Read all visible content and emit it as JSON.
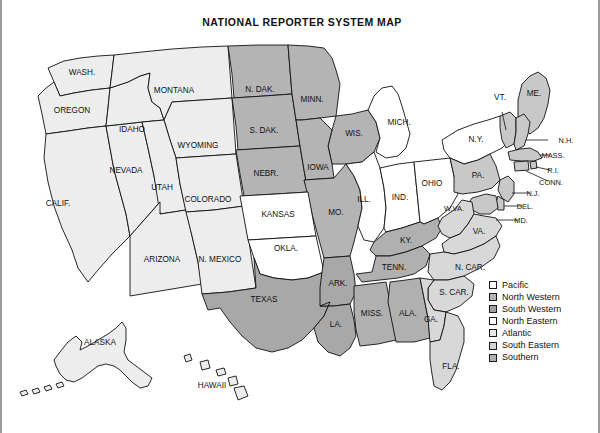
{
  "title": "NATIONAL REPORTER SYSTEM MAP",
  "colors": {
    "pacific": "#ededed",
    "north_western": "#b4b4b4",
    "south_western": "#a8a8a8",
    "north_eastern": "#ffffff",
    "atlantic": "#c8c8c8",
    "south_eastern": "#d8d8d8",
    "southern": "#b0b0b0",
    "outline": "#111111",
    "background": "#ffffff",
    "border": "#9b9b9b"
  },
  "legend": {
    "items": [
      {
        "label": "Pacific",
        "swatch": "#ededed"
      },
      {
        "label": "North Western",
        "swatch": "#b4b4b4"
      },
      {
        "label": "South Western",
        "swatch": "#a8a8a8"
      },
      {
        "label": "North Eastern",
        "swatch": "#ffffff"
      },
      {
        "label": "Atlantic",
        "swatch": "#e2e2e2"
      },
      {
        "label": "South Eastern",
        "swatch": "#d8d8d8"
      },
      {
        "label": "Southern",
        "swatch": "#b0b0b0"
      }
    ]
  },
  "map": {
    "states": [
      {
        "code": "WA",
        "label": "WASH.",
        "region": "Pacific"
      },
      {
        "code": "OR",
        "label": "OREGON",
        "region": "Pacific"
      },
      {
        "code": "CA",
        "label": "CALIF.",
        "region": "Pacific"
      },
      {
        "code": "NV",
        "label": "NEVADA",
        "region": "Pacific"
      },
      {
        "code": "ID",
        "label": "IDAHO",
        "region": "Pacific"
      },
      {
        "code": "MT",
        "label": "MONTANA",
        "region": "Pacific"
      },
      {
        "code": "WY",
        "label": "WYOMING",
        "region": "Pacific"
      },
      {
        "code": "UT",
        "label": "UTAH",
        "region": "Pacific"
      },
      {
        "code": "AZ",
        "label": "ARIZONA",
        "region": "Pacific"
      },
      {
        "code": "CO",
        "label": "COLORADO",
        "region": "Pacific"
      },
      {
        "code": "NM",
        "label": "N. MEXICO",
        "region": "Pacific"
      },
      {
        "code": "AK",
        "label": "ALASKA",
        "region": "Pacific"
      },
      {
        "code": "HI",
        "label": "HAWAII",
        "region": "Pacific"
      },
      {
        "code": "ND",
        "label": "N. DAK.",
        "region": "North Western"
      },
      {
        "code": "SD",
        "label": "S. DAK.",
        "region": "North Western"
      },
      {
        "code": "NE",
        "label": "NEBR.",
        "region": "North Western"
      },
      {
        "code": "MN",
        "label": "MINN.",
        "region": "North Western"
      },
      {
        "code": "WI",
        "label": "WIS.",
        "region": "North Western"
      },
      {
        "code": "IA",
        "label": "IOWA",
        "region": "North Western"
      },
      {
        "code": "MO",
        "label": "MO.",
        "region": "North Western"
      },
      {
        "code": "KS",
        "label": "KANSAS",
        "region": "North Eastern"
      },
      {
        "code": "OK",
        "label": "OKLA.",
        "region": "North Eastern"
      },
      {
        "code": "TX",
        "label": "TEXAS",
        "region": "South Western"
      },
      {
        "code": "AR",
        "label": "ARK.",
        "region": "South Western"
      },
      {
        "code": "LA",
        "label": "LA.",
        "region": "South Western"
      },
      {
        "code": "MI",
        "label": "MICH.",
        "region": "North Eastern"
      },
      {
        "code": "IL",
        "label": "ILL.",
        "region": "North Eastern"
      },
      {
        "code": "IN",
        "label": "IND.",
        "region": "North Eastern"
      },
      {
        "code": "OH",
        "label": "OHIO",
        "region": "North Eastern"
      },
      {
        "code": "NY",
        "label": "N.Y.",
        "region": "North Eastern"
      },
      {
        "code": "PA",
        "label": "PA.",
        "region": "Atlantic"
      },
      {
        "code": "ME",
        "label": "ME.",
        "region": "Atlantic"
      },
      {
        "code": "VT",
        "label": "VT.",
        "region": "Atlantic"
      },
      {
        "code": "NH",
        "label": "N.H.",
        "region": "Atlantic"
      },
      {
        "code": "MA",
        "label": "MASS.",
        "region": "Atlantic"
      },
      {
        "code": "RI",
        "label": "R.I.",
        "region": "Atlantic"
      },
      {
        "code": "CT",
        "label": "CONN.",
        "region": "Atlantic"
      },
      {
        "code": "NJ",
        "label": "N.J.",
        "region": "Atlantic"
      },
      {
        "code": "DE",
        "label": "DEL.",
        "region": "Atlantic"
      },
      {
        "code": "MD",
        "label": "MD.",
        "region": "Atlantic"
      },
      {
        "code": "WV",
        "label": "W.VA.",
        "region": "South Eastern"
      },
      {
        "code": "VA",
        "label": "VA.",
        "region": "South Eastern"
      },
      {
        "code": "NC",
        "label": "N. CAR.",
        "region": "South Eastern"
      },
      {
        "code": "SC",
        "label": "S. CAR.",
        "region": "South Eastern"
      },
      {
        "code": "GA",
        "label": "GA.",
        "region": "South Eastern"
      },
      {
        "code": "FL",
        "label": "FLA.",
        "region": "South Eastern"
      },
      {
        "code": "KY",
        "label": "KY.",
        "region": "Southern"
      },
      {
        "code": "TN",
        "label": "TENN.",
        "region": "Southern"
      },
      {
        "code": "MS",
        "label": "MISS.",
        "region": "Southern"
      },
      {
        "code": "AL",
        "label": "ALA.",
        "region": "Southern"
      }
    ]
  }
}
